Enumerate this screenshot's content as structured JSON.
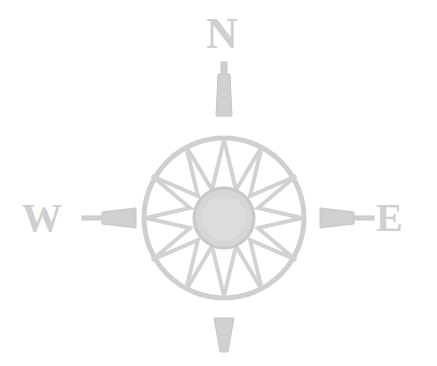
{
  "compass": {
    "labels": {
      "north": "N",
      "west": "W",
      "east": "E"
    },
    "colors": {
      "ink": "#cfcfcf",
      "ink_dark": "#bdbdbd",
      "background": "#ffffff"
    },
    "points": 16
  }
}
